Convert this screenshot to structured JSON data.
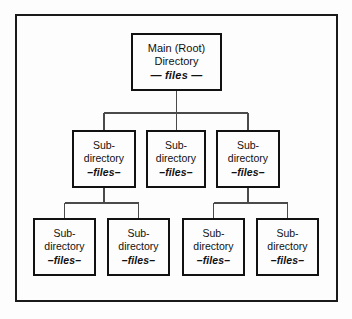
{
  "figure": {
    "colors": {
      "box_border": "#111111",
      "frame_border": "#1a1a1a",
      "connector": "#4a4a4a",
      "background": "#fdfdfd",
      "text": "#111111"
    }
  },
  "nodes": {
    "root": {
      "line1": "Main (Root)",
      "line2": "Directory",
      "files": "— files —"
    },
    "middle": [
      {
        "line1": "Sub-",
        "line2": "directory",
        "files": "–files–"
      },
      {
        "line1": "Sub-",
        "line2": "directory",
        "files": "–files–"
      },
      {
        "line1": "Sub-",
        "line2": "directory",
        "files": "–files–"
      }
    ],
    "bottom": [
      {
        "line1": "Sub-",
        "line2": "directory",
        "files": "–files–"
      },
      {
        "line1": "Sub-",
        "line2": "directory",
        "files": "–files–"
      },
      {
        "line1": "Sub-",
        "line2": "directory",
        "files": "–files–"
      },
      {
        "line1": "Sub-",
        "line2": "directory",
        "files": "–files–"
      }
    ]
  }
}
